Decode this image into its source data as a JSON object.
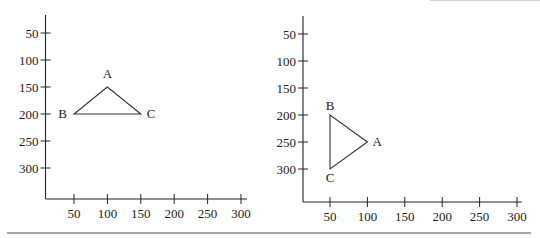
{
  "chart_data": [
    {
      "type": "scatter",
      "title": "",
      "description": "Triangle ABC plotted in screen coordinates (y increases downward)",
      "x_ticks": [
        50,
        100,
        150,
        200,
        250,
        300
      ],
      "y_ticks": [
        50,
        100,
        150,
        200,
        250,
        300
      ],
      "xlabel": "",
      "ylabel": "",
      "xlim": [
        0,
        310
      ],
      "ylim": [
        0,
        350
      ],
      "grid": false,
      "points": [
        {
          "label": "A",
          "x": 100,
          "y": 150
        },
        {
          "label": "B",
          "x": 50,
          "y": 200
        },
        {
          "label": "C",
          "x": 150,
          "y": 200
        }
      ]
    },
    {
      "type": "scatter",
      "title": "",
      "description": "Triangle ABC after rotation, screen coordinates (y increases downward)",
      "x_ticks": [
        50,
        100,
        150,
        200,
        250,
        300
      ],
      "y_ticks": [
        50,
        100,
        150,
        200,
        250,
        300
      ],
      "xlabel": "",
      "ylabel": "",
      "xlim": [
        0,
        310
      ],
      "ylim": [
        0,
        350
      ],
      "grid": false,
      "points": [
        {
          "label": "A",
          "x": 100,
          "y": 250
        },
        {
          "label": "B",
          "x": 50,
          "y": 200
        },
        {
          "label": "C",
          "x": 50,
          "y": 300
        }
      ]
    }
  ],
  "tick_labels": [
    "50",
    "100",
    "150",
    "200",
    "250",
    "300"
  ]
}
